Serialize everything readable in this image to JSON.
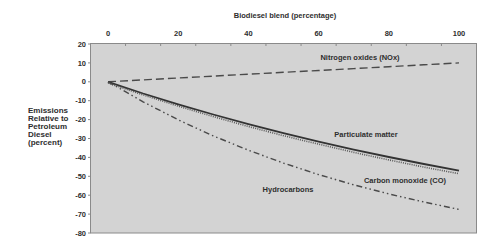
{
  "chart_data": {
    "type": "line",
    "title": "",
    "xlabel": "Biodiesel blend (percentage)",
    "ylabel": "Emissions Relative to Petroleum Diesel (percent)",
    "ylabel_lines": [
      "Emissions",
      "Relative to",
      "Petroleum",
      "Diesel",
      "(percent)"
    ],
    "xlim": [
      -5,
      105
    ],
    "ylim": [
      -80,
      20
    ],
    "x_ticks": [
      0,
      20,
      40,
      60,
      80,
      100
    ],
    "y_ticks": [
      20,
      10,
      0,
      -10,
      -20,
      -30,
      -40,
      -50,
      -60,
      -70,
      -80
    ],
    "x_axis_position": "top",
    "grid": false,
    "legend": "inline labels",
    "x": [
      0,
      10,
      20,
      30,
      40,
      50,
      60,
      70,
      80,
      90,
      100
    ],
    "series": [
      {
        "name": "Nitrogen oxides (NOx)",
        "style": "dashed",
        "values": [
          0,
          1,
          2,
          3,
          4,
          5,
          6,
          7,
          8,
          9,
          10
        ],
        "label_pos": [
          360,
          57
        ]
      },
      {
        "name": "Particulate matter",
        "style": "solid",
        "values": [
          0,
          -6.2,
          -11.9,
          -17.3,
          -22.4,
          -27.2,
          -31.7,
          -35.9,
          -39.8,
          -43.5,
          -47
        ],
        "label_pos": [
          366,
          134
        ]
      },
      {
        "name": "Carbon monoxide (CO)",
        "style": "dotted",
        "values": [
          0,
          -6.3,
          -12.2,
          -17.8,
          -23.0,
          -27.9,
          -32.4,
          -36.7,
          -40.7,
          -44.5,
          -48
        ],
        "label_pos": [
          405,
          180
        ]
      },
      {
        "name": "Hydrocarbons",
        "style": "dash-dot-dot",
        "values": [
          0,
          -10.6,
          -20.1,
          -28.6,
          -36.2,
          -43.0,
          -49.1,
          -54.5,
          -59.3,
          -63.6,
          -67.5
        ],
        "label_pos": [
          288,
          189
        ]
      }
    ],
    "colors": {
      "plot_background": "#d3d3d3",
      "plot_border": "#8a8a8a",
      "line": "#3a3a3a",
      "text": "#2e2e2e"
    }
  }
}
